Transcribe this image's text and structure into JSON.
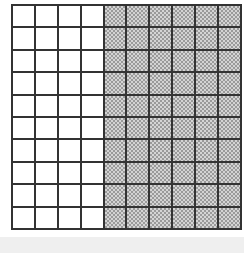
{
  "grid": {
    "rows": 10,
    "cols": 10,
    "shaded_cols_start": 4,
    "shaded_count": 60,
    "unshaded_count": 40,
    "total": 100,
    "shade_color": "#a8a8a8",
    "line_color": "#333333"
  }
}
